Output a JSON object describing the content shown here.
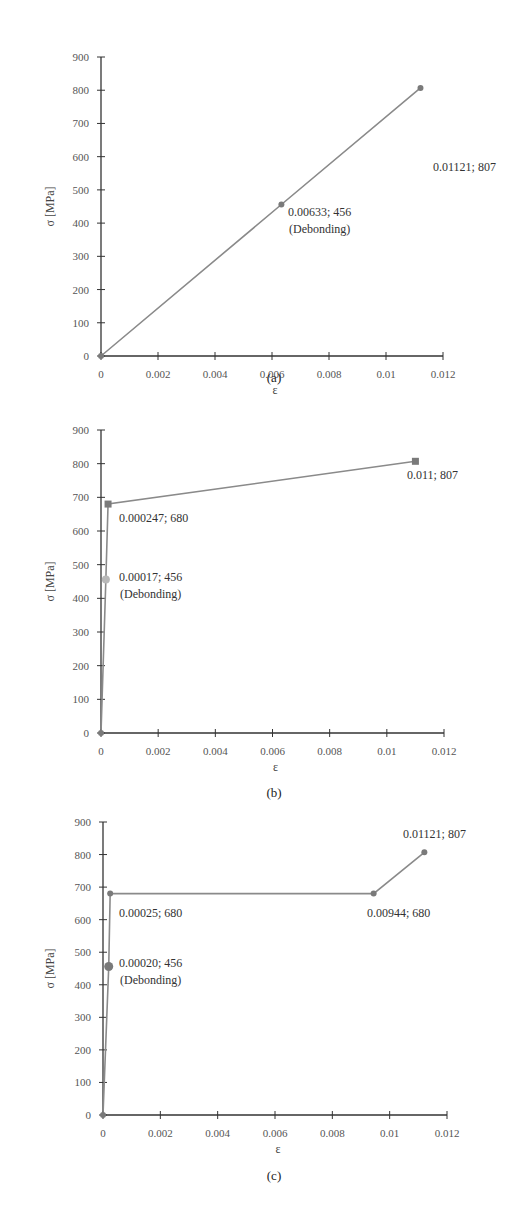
{
  "chart_data": [
    {
      "type": "line",
      "panel": "(a)",
      "caption": "(a)",
      "xlabel": "ε",
      "ylabel": "σ [MPa]",
      "xlim": [
        0,
        0.012
      ],
      "ylim": [
        0,
        900
      ],
      "xticks": [
        "0",
        "0.002",
        "0.004",
        "0.006",
        "0.008",
        "0.01",
        "0.012"
      ],
      "yticks": [
        "0",
        "100",
        "200",
        "300",
        "400",
        "500",
        "600",
        "700",
        "800",
        "900"
      ],
      "series": [
        {
          "name": "stress-strain",
          "x": [
            0,
            0.00633,
            0.01121
          ],
          "y": [
            0,
            456,
            807
          ]
        }
      ],
      "annotations": [
        {
          "text": "0.00633; 456",
          "sub": "(Debonding)",
          "x": 0.00633,
          "y": 456
        },
        {
          "text": "0.01121; 807",
          "x": 0.01121,
          "y": 807
        }
      ]
    },
    {
      "type": "line",
      "panel": "(b)",
      "caption": "(b)",
      "xlabel": "ε",
      "ylabel": "σ [MPa]",
      "xlim": [
        0,
        0.012
      ],
      "ylim": [
        0,
        900
      ],
      "xticks": [
        "0",
        "0.002",
        "0.004",
        "0.006",
        "0.008",
        "0.01",
        "0.012"
      ],
      "yticks": [
        "0",
        "100",
        "200",
        "300",
        "400",
        "500",
        "600",
        "700",
        "800",
        "900"
      ],
      "series": [
        {
          "name": "stress-strain",
          "x": [
            0,
            0.00017,
            0.000247,
            0.011
          ],
          "y": [
            0,
            456,
            680,
            807
          ]
        }
      ],
      "annotations": [
        {
          "text": "0.00017; 456",
          "sub": "(Debonding)",
          "x": 0.00017,
          "y": 456
        },
        {
          "text": "0.000247; 680",
          "x": 0.000247,
          "y": 680
        },
        {
          "text": "0.011; 807",
          "x": 0.011,
          "y": 807
        }
      ]
    },
    {
      "type": "line",
      "panel": "(c)",
      "caption": "(c)",
      "xlabel": "ε",
      "ylabel": "σ [MPa]",
      "xlim": [
        0,
        0.012
      ],
      "ylim": [
        0,
        900
      ],
      "xticks": [
        "0",
        "0.002",
        "0.004",
        "0.006",
        "0.008",
        "0.01",
        "0.012"
      ],
      "yticks": [
        "0",
        "100",
        "200",
        "300",
        "400",
        "500",
        "600",
        "700",
        "800",
        "900"
      ],
      "series": [
        {
          "name": "stress-strain",
          "x": [
            0,
            0.0002,
            0.00025,
            0.00944,
            0.01121
          ],
          "y": [
            0,
            456,
            680,
            680,
            807
          ]
        }
      ],
      "annotations": [
        {
          "text": "0.00020; 456",
          "sub": "(Debonding)",
          "x": 0.0002,
          "y": 456
        },
        {
          "text": "0.00025; 680",
          "x": 0.00025,
          "y": 680
        },
        {
          "text": "0.00944; 680",
          "x": 0.00944,
          "y": 680
        },
        {
          "text": "0.01121; 807",
          "x": 0.01121,
          "y": 807
        }
      ]
    }
  ],
  "colors": {
    "line": "#8a8a8a",
    "axis": "#333333",
    "marker": "#7a7a7a",
    "debond_marker_b": "#b8b8b8"
  }
}
